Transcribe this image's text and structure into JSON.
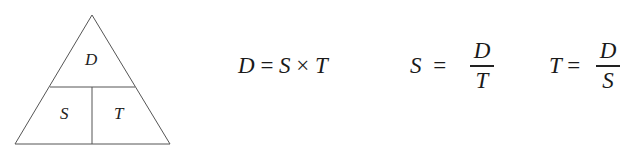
{
  "triangle": {
    "top": "D",
    "bottom_left": "S",
    "bottom_right": "T"
  },
  "equations": {
    "eq1": {
      "lhs": "D",
      "eq": "=",
      "a": "S",
      "op": "×",
      "b": "T"
    },
    "eq2": {
      "lhs": "S",
      "eq": "=",
      "num": "D",
      "den": "T"
    },
    "eq3": {
      "lhs": "T",
      "eq": "=",
      "num": "D",
      "den": "S"
    }
  }
}
